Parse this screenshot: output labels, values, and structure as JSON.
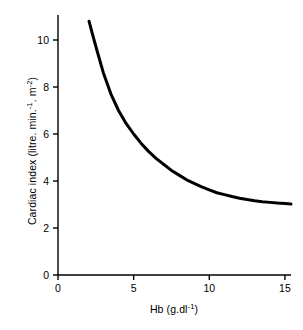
{
  "chart_data": {
    "type": "line",
    "title": "",
    "subtitle": "",
    "xlabel": "Hb (g.dl⁻¹)",
    "ylabel": "Cardiac index (litre. min.⁻¹. m⁻²)",
    "xlabel_parts": {
      "base": "Hb (g.dl",
      "sup": "-1",
      "tail": ")"
    },
    "ylabel_parts": {
      "base": "Cardiac index (litre. min.",
      "sup1": "-1",
      "mid": ". m",
      "sup2": "-2",
      "tail": ")"
    },
    "xlim": [
      0,
      15.4
    ],
    "ylim": [
      0,
      11.2
    ],
    "xticks": [
      0,
      5,
      10,
      15
    ],
    "xtick_labels": [
      "0",
      "5",
      "10",
      "15"
    ],
    "yticks": [
      0,
      2,
      4,
      6,
      8,
      10
    ],
    "ytick_labels": [
      "0",
      "2",
      "4",
      "6",
      "8",
      "10"
    ],
    "grid": false,
    "legend": "none",
    "axis_style": "left-and-bottom-spines-with-outward-ticks",
    "line_color": "#000000",
    "line_width_px": 3,
    "series": [
      {
        "name": "Cardiac index vs haemoglobin",
        "x": [
          2.05,
          2.3,
          2.6,
          3.0,
          3.5,
          4.0,
          4.5,
          5.0,
          5.5,
          6.0,
          6.5,
          7.0,
          7.5,
          8.0,
          8.5,
          9.0,
          9.5,
          10.0,
          10.5,
          11.0,
          11.5,
          12.0,
          12.5,
          13.0,
          13.5,
          14.0,
          14.5,
          15.0,
          15.4
        ],
        "y": [
          10.8,
          10.2,
          9.5,
          8.6,
          7.7,
          7.0,
          6.45,
          6.0,
          5.6,
          5.25,
          4.95,
          4.7,
          4.45,
          4.25,
          4.05,
          3.9,
          3.75,
          3.62,
          3.5,
          3.42,
          3.34,
          3.27,
          3.21,
          3.16,
          3.12,
          3.09,
          3.06,
          3.04,
          3.02
        ]
      }
    ]
  },
  "figure": {
    "background_color": "#ffffff",
    "text_color": "#000000"
  }
}
